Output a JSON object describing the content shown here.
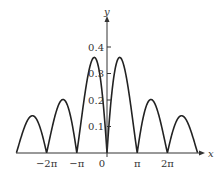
{
  "chart_data": {
    "type": "line",
    "title": "",
    "xlabel": "x",
    "ylabel": "y",
    "x_ticks": [
      {
        "value": -6.2832,
        "label": "−2π"
      },
      {
        "value": -3.1416,
        "label": "−π"
      },
      {
        "value": 0,
        "label": "0"
      },
      {
        "value": 3.1416,
        "label": "π"
      },
      {
        "value": 6.2832,
        "label": "2π"
      }
    ],
    "y_ticks": [
      {
        "value": 0.1,
        "label": "0.1"
      },
      {
        "value": 0.2,
        "label": "0.2"
      },
      {
        "value": 0.3,
        "label": "0.3"
      },
      {
        "value": 0.4,
        "label": "0.4"
      }
    ],
    "xlim": [
      -9.42,
      9.42
    ],
    "ylim": [
      0,
      0.45
    ],
    "grid": false,
    "legend": null,
    "series": [
      {
        "name": "curve",
        "description": "Symmetric arches touching zero at integer multiples of π; peaks decrease away from origin",
        "peaks": [
          {
            "x": -7.85,
            "y": 0.125
          },
          {
            "x": -4.71,
            "y": 0.2
          },
          {
            "x": -1.57,
            "y": 0.35
          },
          {
            "x": 1.57,
            "y": 0.35
          },
          {
            "x": 4.71,
            "y": 0.2
          },
          {
            "x": 7.85,
            "y": 0.125
          }
        ],
        "zeros": [
          -9.42,
          -6.28,
          -3.14,
          0,
          3.14,
          6.28,
          9.42
        ]
      }
    ]
  }
}
